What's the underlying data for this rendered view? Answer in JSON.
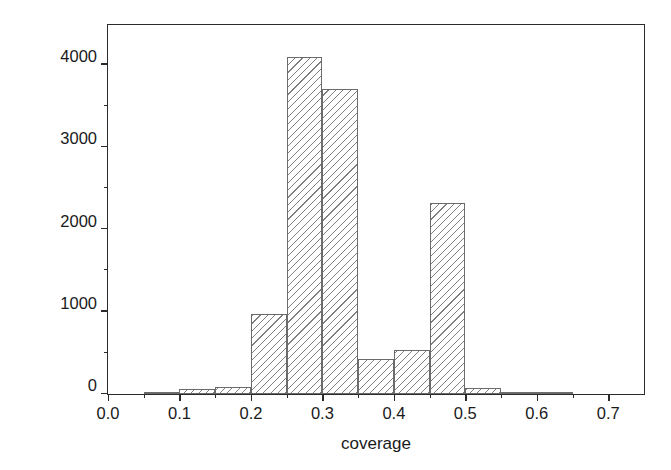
{
  "chart_data": {
    "type": "bar",
    "title": "",
    "subtitle": "",
    "xlabel": "coverage",
    "ylabel": "Count",
    "xlim": [
      0.0,
      0.75
    ],
    "ylim": [
      0,
      4480
    ],
    "grid": false,
    "legend": null,
    "histogram": true,
    "bin_width": 0.05,
    "bin_edges": [
      0.05,
      0.1,
      0.15,
      0.2,
      0.25,
      0.3,
      0.35,
      0.4,
      0.45,
      0.5,
      0.55,
      0.6,
      0.65
    ],
    "categories": [
      "0.05-0.10",
      "0.10-0.15",
      "0.15-0.20",
      "0.20-0.25",
      "0.25-0.30",
      "0.30-0.35",
      "0.35-0.40",
      "0.40-0.45",
      "0.45-0.50",
      "0.50-0.55",
      "0.55-0.60",
      "0.60-0.65"
    ],
    "values": [
      25,
      60,
      80,
      970,
      4090,
      3700,
      430,
      540,
      2320,
      75,
      20,
      25
    ],
    "bars": [
      {
        "label": "0.05-0.10",
        "x0": 0.05,
        "x1": 0.1,
        "value": 25
      },
      {
        "label": "0.10-0.15",
        "x0": 0.1,
        "x1": 0.15,
        "value": 60
      },
      {
        "label": "0.15-0.20",
        "x0": 0.15,
        "x1": 0.2,
        "value": 80
      },
      {
        "label": "0.20-0.25",
        "x0": 0.2,
        "x1": 0.25,
        "value": 970
      },
      {
        "label": "0.25-0.30",
        "x0": 0.25,
        "x1": 0.3,
        "value": 4090
      },
      {
        "label": "0.30-0.35",
        "x0": 0.3,
        "x1": 0.35,
        "value": 3700
      },
      {
        "label": "0.35-0.40",
        "x0": 0.35,
        "x1": 0.4,
        "value": 430
      },
      {
        "label": "0.40-0.45",
        "x0": 0.4,
        "x1": 0.45,
        "value": 540
      },
      {
        "label": "0.45-0.50",
        "x0": 0.45,
        "x1": 0.5,
        "value": 2320
      },
      {
        "label": "0.50-0.55",
        "x0": 0.5,
        "x1": 0.55,
        "value": 75
      },
      {
        "label": "0.55-0.60",
        "x0": 0.55,
        "x1": 0.6,
        "value": 20
      },
      {
        "label": "0.60-0.65",
        "x0": 0.6,
        "x1": 0.65,
        "value": 25
      }
    ],
    "yticks": [
      0,
      1000,
      2000,
      3000,
      4000
    ],
    "ytick_labels": [
      "0",
      "1000",
      "2000",
      "3000",
      "4000"
    ],
    "yticks_minor": [
      500,
      1500,
      2500,
      3500
    ],
    "xticks": [
      0.0,
      0.1,
      0.2,
      0.3,
      0.4,
      0.5,
      0.6,
      0.7
    ],
    "xtick_labels": [
      "0.0",
      "0.1",
      "0.2",
      "0.3",
      "0.4",
      "0.5",
      "0.6",
      "0.7"
    ],
    "xticks_minor": [
      0.05,
      0.15,
      0.25,
      0.35,
      0.45,
      0.55,
      0.65
    ],
    "style": {
      "bar_edge_color": "#6b6b6b",
      "bar_fill": "#ffffff",
      "bar_hatch": "diagonal-lines",
      "axis_color": "#2b2b2b",
      "background": "#ffffff",
      "text_color": "#1a1a1a"
    }
  }
}
